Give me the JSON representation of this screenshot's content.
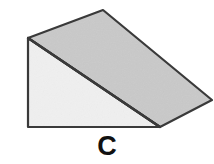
{
  "figure": {
    "label": "C",
    "kind": "wedge-ramp-solid",
    "canvas": {
      "width": 214,
      "height": 164
    },
    "background_color": "#ffffff",
    "outline_color": "#3a3a3a",
    "outline_width": 2.2,
    "faces": [
      {
        "name": "top-inclined-face",
        "fill_color": "#c9c9c9",
        "points": "28,38 103,10 212,100 160,127"
      },
      {
        "name": "front-left-triangular-face",
        "fill_color": "#f0f0f0",
        "points": "28,38 28,127 160,127"
      }
    ],
    "edges": [
      {
        "name": "back-top-left-to-apex",
        "from": [
          28,
          38
        ],
        "to": [
          103,
          10
        ]
      },
      {
        "name": "apex-to-right-vertex",
        "from": [
          103,
          10
        ],
        "to": [
          212,
          100
        ]
      },
      {
        "name": "right-vertex-to-bottom-right",
        "from": [
          212,
          100
        ],
        "to": [
          160,
          127
        ]
      },
      {
        "name": "ridge-diagonal",
        "from": [
          28,
          38
        ],
        "to": [
          160,
          127
        ]
      },
      {
        "name": "left-vertical-edge",
        "from": [
          28,
          38
        ],
        "to": [
          28,
          127
        ]
      },
      {
        "name": "bottom-horizontal-edge",
        "from": [
          28,
          127
        ],
        "to": [
          160,
          127
        ]
      }
    ],
    "vertices": {
      "back-top-left": [
        28,
        38
      ],
      "top-apex": [
        103,
        10
      ],
      "right": [
        212,
        100
      ],
      "bottom-right": [
        160,
        127
      ],
      "bottom-left": [
        28,
        127
      ]
    }
  }
}
